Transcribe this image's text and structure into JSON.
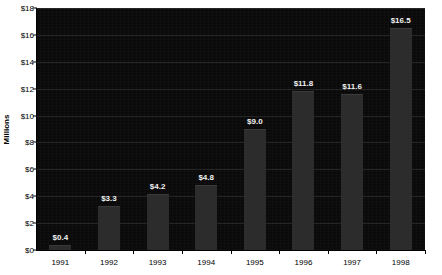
{
  "chart_data": {
    "type": "bar",
    "title": "",
    "subtitle": "",
    "xlabel": "",
    "ylabel": "Millions",
    "categories": [
      "1991",
      "1992",
      "1993",
      "1994",
      "1995",
      "1996",
      "1997",
      "1998"
    ],
    "values": [
      0.4,
      3.3,
      4.2,
      4.8,
      9.0,
      11.8,
      11.6,
      16.5
    ],
    "data_labels": [
      "$0.4",
      "$3.3",
      "$4.2",
      "$4.8",
      "$9.0",
      "$11.8",
      "$11.6",
      "$16.5"
    ],
    "ylim": [
      0,
      18
    ],
    "ytick_values": [
      0,
      2,
      4,
      6,
      8,
      10,
      12,
      14,
      16,
      18
    ],
    "ytick_labels": [
      "$0",
      "$2",
      "$4",
      "$6",
      "$8",
      "$10",
      "$12",
      "$14",
      "$16",
      "$18"
    ],
    "grid": true,
    "grid_axis": "y",
    "legend": false,
    "legend_position": "none",
    "series": [
      {
        "name": "",
        "values": [
          0.4,
          3.3,
          4.2,
          4.8,
          9.0,
          11.8,
          11.6,
          16.5
        ]
      }
    ],
    "colors": {
      "plot_background": "#0a0a0a",
      "page_background": "#ffffff",
      "bar_fill": "#2c2c2c",
      "data_label_text": "#f2f2f2",
      "axis_text": "#000000",
      "gridline": "#1e1e1e"
    }
  }
}
